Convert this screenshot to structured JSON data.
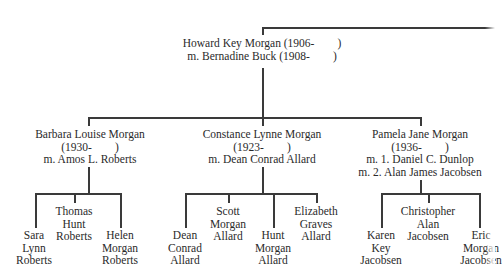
{
  "diagram": {
    "type": "family-tree",
    "root": {
      "lines": [
        "Howard Key Morgan (1906-        )",
        "m. Bernadine Buck (1908-        )"
      ]
    },
    "children": [
      {
        "lines": [
          "Barbara Louise Morgan",
          "(1930-        )",
          "m. Amos L. Roberts"
        ],
        "children": [
          {
            "lines": [
              "Sara",
              "Lynn",
              "Roberts"
            ]
          },
          {
            "lines": [
              "Thomas",
              "Hunt",
              "Roberts"
            ]
          },
          {
            "lines": [
              "Helen",
              "Morgan",
              "Roberts"
            ]
          }
        ]
      },
      {
        "lines": [
          "Constance Lynne Morgan",
          "(1923-        )",
          "m. Dean Conrad Allard"
        ],
        "children": [
          {
            "lines": [
              "Dean",
              "Conrad",
              "Allard"
            ]
          },
          {
            "lines": [
              "Scott",
              "Morgan",
              "Allard"
            ]
          },
          {
            "lines": [
              "Hunt",
              "Morgan",
              "Allard"
            ]
          },
          {
            "lines": [
              "Elizabeth",
              "Graves",
              "Allard"
            ]
          }
        ]
      },
      {
        "lines": [
          "Pamela Jane Morgan",
          "(1936-        )",
          "m. 1. Daniel C. Dunlop",
          "m. 2. Alan James Jacobsen"
        ],
        "children": [
          {
            "lines": [
              "Karen",
              "Key",
              "Jacobsen"
            ]
          },
          {
            "lines": [
              "Christopher",
              "Alan",
              "Jacobsen"
            ]
          },
          {
            "lines": [
              "Eric",
              "Morgan",
              "Jacobsen"
            ]
          }
        ]
      }
    ]
  }
}
